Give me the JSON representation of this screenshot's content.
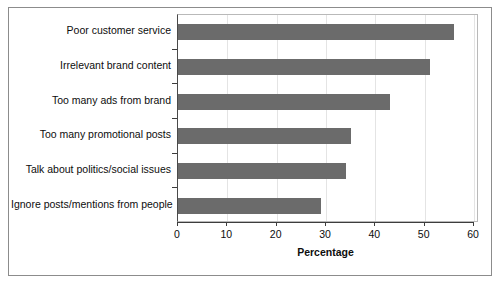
{
  "chart_data": {
    "type": "bar",
    "orientation": "horizontal",
    "title": "",
    "xlabel": "Percentage",
    "ylabel": "",
    "xlim": [
      0,
      60
    ],
    "xticks": [
      0,
      10,
      20,
      30,
      40,
      50,
      60
    ],
    "grid": true,
    "legend": null,
    "bar_color": "#6b6b6b",
    "categories": [
      "Poor customer service",
      "Irrelevant brand content",
      "Too many ads from brand",
      "Too many promotional posts",
      "Talk about politics/social issues",
      "Ignore posts/mentions from people"
    ],
    "values": [
      56,
      51,
      43,
      35,
      34,
      29
    ]
  }
}
